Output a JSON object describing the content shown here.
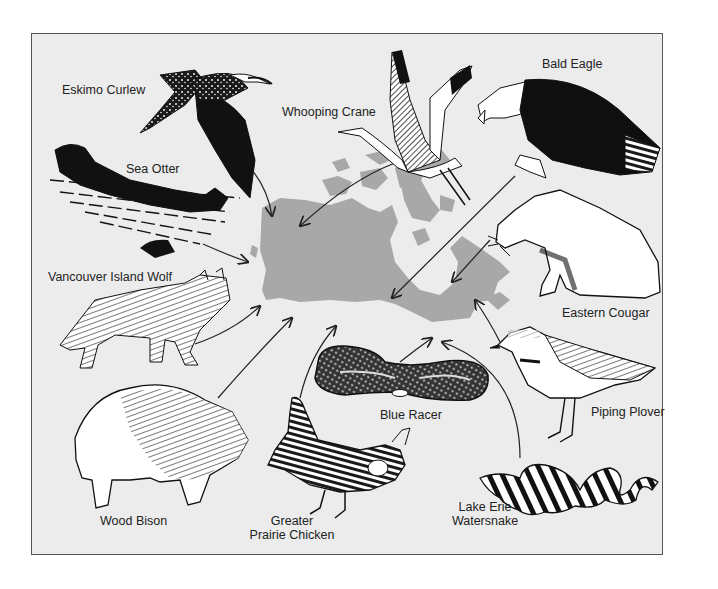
{
  "figure": {
    "title": "",
    "colors": {
      "background": "#ececec",
      "border": "#555555",
      "map": "#a8a8a8",
      "ink": "#1a1a1a",
      "white_fill": "#ffffff"
    },
    "center_map": {
      "label": "",
      "shape": "Canada silhouette"
    },
    "animals": [
      {
        "id": "eskimo-curlew",
        "label": "Eskimo Curlew"
      },
      {
        "id": "whooping-crane",
        "label": "Whooping Crane"
      },
      {
        "id": "bald-eagle",
        "label": "Bald Eagle"
      },
      {
        "id": "sea-otter",
        "label": "Sea Otter"
      },
      {
        "id": "vancouver-island-wolf",
        "label": "Vancouver Island Wolf"
      },
      {
        "id": "eastern-cougar",
        "label": "Eastern Cougar"
      },
      {
        "id": "blue-racer",
        "label": "Blue Racer"
      },
      {
        "id": "piping-plover",
        "label": "Piping Plover"
      },
      {
        "id": "wood-bison",
        "label": "Wood Bison"
      },
      {
        "id": "greater-prairie-chicken",
        "label_line1": "Greater",
        "label_line2": "Prairie Chicken"
      },
      {
        "id": "lake-erie-watersnake",
        "label_line1": "Lake Erie",
        "label_line2": "Watersnake"
      }
    ]
  }
}
